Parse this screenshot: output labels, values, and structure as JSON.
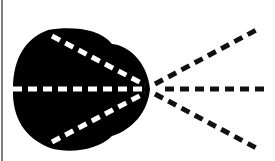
{
  "diagram": {
    "colors": {
      "background": "#ffffff",
      "blob": "#000000",
      "ray_inside": "#ffffff",
      "ray_outside": "#111111",
      "border": "#555555"
    },
    "focal_point": [
      150,
      89
    ],
    "rays": [
      {
        "name": "upper",
        "from": [
          48,
          32
        ],
        "to": [
          260,
          28
        ]
      },
      {
        "name": "middle",
        "from": [
          13,
          89
        ],
        "to": [
          270,
          89
        ]
      },
      {
        "name": "lower",
        "from": [
          48,
          146
        ],
        "to": [
          260,
          150
        ]
      }
    ]
  }
}
